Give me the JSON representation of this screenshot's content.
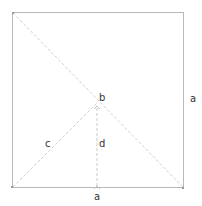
{
  "diagram": {
    "colors": {
      "square": "#b8b8b8",
      "dashed": "#c8c8c8",
      "text": "#333333"
    },
    "labels": {
      "side_bottom": "a",
      "side_right": "a",
      "center": "b",
      "diagonal_segment": "c",
      "height_segment": "d"
    },
    "square": {
      "x": 12,
      "y": 12,
      "size": 172
    },
    "center_point": {
      "x": 97,
      "y": 100
    }
  }
}
